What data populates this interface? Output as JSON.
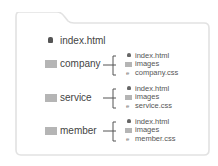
{
  "root": {
    "file": {
      "name": "index.html",
      "icon": "html-file-icon"
    }
  },
  "folders": [
    {
      "name": "company",
      "icon": "folder-icon",
      "children": [
        {
          "name": "index.html",
          "icon": "html-file-icon"
        },
        {
          "name": "images",
          "icon": "folder-icon"
        },
        {
          "name": "company.css",
          "icon": "css-file-icon"
        }
      ]
    },
    {
      "name": "service",
      "icon": "folder-icon",
      "children": [
        {
          "name": "index.html",
          "icon": "html-file-icon"
        },
        {
          "name": "images",
          "icon": "folder-icon"
        },
        {
          "name": "service.css",
          "icon": "css-file-icon"
        }
      ]
    },
    {
      "name": "member",
      "icon": "folder-icon",
      "children": [
        {
          "name": "index.html",
          "icon": "html-file-icon"
        },
        {
          "name": "images",
          "icon": "folder-icon"
        },
        {
          "name": "member.css",
          "icon": "css-file-icon"
        }
      ]
    }
  ],
  "colors": {
    "outline": "#e2e2e2",
    "folder_icon": "#b5b5b5",
    "text": "#444444"
  }
}
